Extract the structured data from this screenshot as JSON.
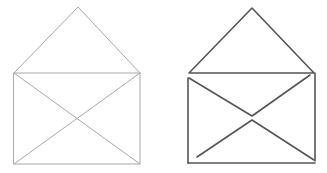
{
  "figures": [
    {
      "name": "open-envelope-light",
      "stroke": "#a8a8a8",
      "stroke_width": 1,
      "flap": {
        "apex": [
          78,
          7
        ],
        "left": [
          14,
          73
        ],
        "right": [
          140,
          73
        ]
      },
      "body": {
        "x": 14,
        "y": 73,
        "width": 126,
        "height": 91
      },
      "diagonals": [
        [
          [
            14,
            73
          ],
          [
            140,
            164
          ]
        ],
        [
          [
            140,
            73
          ],
          [
            14,
            164
          ]
        ]
      ]
    },
    {
      "name": "open-envelope-dark",
      "stroke": "#555555",
      "stroke_width": 1.6,
      "flap": {
        "apex": [
          252,
          8
        ],
        "left": [
          189,
          73
        ],
        "right": [
          314,
          73
        ]
      },
      "body_left": [
        [
          188,
          78
        ],
        [
          188,
          163
        ]
      ],
      "body_right": [
        [
          315,
          73
        ],
        [
          315,
          161
        ]
      ],
      "body_bottom": [
        [
          188,
          163
        ],
        [
          315,
          163
        ]
      ],
      "upper_v": [
        [
          189,
          78
        ],
        [
          252,
          116
        ],
        [
          310,
          75
        ]
      ],
      "lower_v": [
        [
          197,
          157
        ],
        [
          252,
          120
        ],
        [
          314,
          160
        ]
      ]
    }
  ]
}
